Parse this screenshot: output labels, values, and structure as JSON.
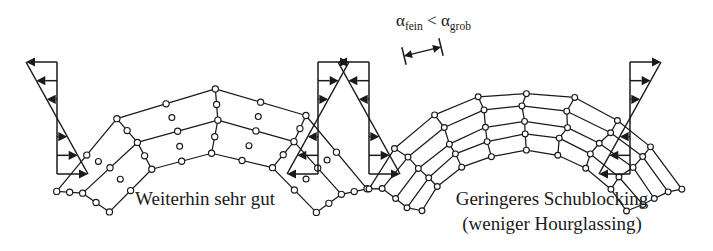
{
  "figure": {
    "background_color": "#ffffff",
    "ink_color": "#1a1a1a",
    "width": 713,
    "height": 251
  },
  "annotation": {
    "alpha_symbol": "α",
    "sub_fine": "fein",
    "less_than": "<",
    "sub_coarse": "grob",
    "full_text": "αfein < αgrob",
    "dimension_marker": "element-width-dimension-arrow"
  },
  "panels": [
    {
      "id": "left",
      "caption_lines": [
        "Weiterhin sehr gut"
      ],
      "mesh": {
        "element_type": "9-node quadratic quadrilateral",
        "columns": 4,
        "rows": 2,
        "has_center_nodes": true,
        "has_midside_nodes": true,
        "node_radius": 3.1,
        "arch": {
          "center_x": 213,
          "center_y": 268,
          "inner_radius": 118,
          "outer_radius": 176,
          "start_angle_deg": -152,
          "end_angle_deg": -28
        }
      },
      "stress_left": {
        "type": "bending-stress-profile",
        "top_direction": "left",
        "bottom_direction": "right",
        "arrow_count_top": 3,
        "arrow_count_bottom": 3,
        "axis_x": 57,
        "top_y": 62,
        "mid_y": 118,
        "bottom_y": 174,
        "max_extent": 31
      },
      "stress_right": {
        "type": "bending-stress-profile",
        "top_direction": "right",
        "bottom_direction": "left",
        "arrow_count_top": 3,
        "arrow_count_bottom": 3,
        "axis_x": 318,
        "top_y": 62,
        "mid_y": 118,
        "bottom_y": 174,
        "max_extent": 31
      }
    },
    {
      "id": "right",
      "caption_lines": [
        "Geringeres Schublocking",
        "(weniger Hourglassing)"
      ],
      "mesh": {
        "element_type": "4-node linear quadrilateral",
        "columns": 8,
        "rows": 4,
        "has_center_nodes": false,
        "has_midside_nodes": false,
        "node_radius": 2.9,
        "arch": {
          "center_x": 525,
          "center_y": 268,
          "inner_radius": 118,
          "outer_radius": 176,
          "start_angle_deg": -152,
          "end_angle_deg": -28
        }
      },
      "stress_left": {
        "type": "bending-stress-profile",
        "top_direction": "left",
        "bottom_direction": "right",
        "arrow_count_top": 3,
        "arrow_count_bottom": 3,
        "axis_x": 369,
        "top_y": 62,
        "mid_y": 118,
        "bottom_y": 174,
        "max_extent": 31
      },
      "stress_right": {
        "type": "bending-stress-profile",
        "top_direction": "right",
        "bottom_direction": "left",
        "arrow_count_top": 3,
        "arrow_count_bottom": 3,
        "axis_x": 630,
        "top_y": 62,
        "mid_y": 118,
        "bottom_y": 174,
        "max_extent": 31
      }
    }
  ],
  "captions": {
    "left_y": 205,
    "left_x": 205,
    "right_y": 205,
    "right_x": 552,
    "line_height": 25
  }
}
